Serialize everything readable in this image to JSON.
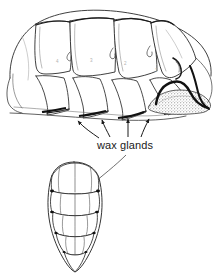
{
  "figure": {
    "kind": "scientific-line-drawing",
    "background_color": "#ffffff",
    "ink_color": "#1a1a1a",
    "stipple_color": "#8c8c8c",
    "labels": [
      {
        "name": "wax-glands",
        "text": "wax glands",
        "x": 97,
        "y": 139,
        "font_size_px": 11
      }
    ],
    "panels": [
      {
        "name": "lateral-view",
        "description": "lateral view of segmented abdomen with overlapping tergites and ventral wax gland secretion",
        "bbox": [
          4,
          8,
          214,
          122
        ]
      },
      {
        "name": "ventral-view",
        "description": "ventral view of abdomen with five overlapping segments tapering to a point",
        "bbox": [
          35,
          158,
          112,
          272
        ]
      }
    ],
    "leaders": {
      "arrow_count_lateral": 4,
      "arrow_count_ventral": 1
    },
    "segment_numbers": [
      "4",
      "3",
      "2",
      "1"
    ]
  }
}
